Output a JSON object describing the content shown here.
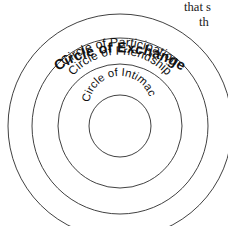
{
  "figure": {
    "name": "circles-of-relationship-diagram",
    "type": "concentric-circles",
    "background_color": "#ffffff",
    "stroke_color": "#2b2b2b",
    "text_color": "#111111",
    "center": {
      "x": 120,
      "y": 126
    },
    "rings": [
      {
        "id": "ring-exchange",
        "label": "Circle of Exchange",
        "level": 1,
        "position": "outermost",
        "radius": 112,
        "bold": true,
        "clipped_at_bottom": true
      },
      {
        "id": "ring-participation",
        "label": "Circle of Participation",
        "level": 2,
        "position": "second",
        "radius": 88,
        "bold": false,
        "clipped_at_bottom": false
      },
      {
        "id": "ring-friendship",
        "label": "Circle of Friendship",
        "level": 3,
        "position": "third",
        "radius": 62,
        "bold": false,
        "clipped_at_bottom": false
      },
      {
        "id": "ring-intimacy",
        "label": "Circle of Intimacy",
        "level": 4,
        "position": "innermost",
        "radius": 31,
        "bold": false,
        "clipped_at_bottom": false
      }
    ]
  },
  "body_text_fragment": {
    "line_1": "that s",
    "line_2": "th"
  }
}
